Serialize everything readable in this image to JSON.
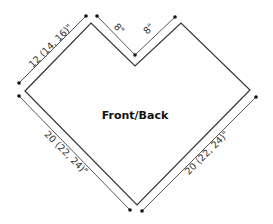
{
  "diagram": {
    "title": "Front/Back",
    "dimensions": {
      "upper_left_edge": "12 (14, 16)\"",
      "notch_left": "8\"",
      "notch_right": "8\"",
      "lower_left_edge": "20 (22, 24)\"",
      "lower_right_edge": "20 (22, 24)\""
    },
    "colors": {
      "line": "#333333",
      "dot": "#111111",
      "background": "#ffffff"
    }
  }
}
